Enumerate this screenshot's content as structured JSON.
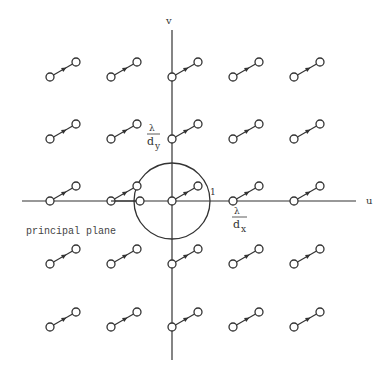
{
  "diagram": {
    "type": "reciprocal-lattice grating lobes diagram",
    "axes": {
      "u_label": "u",
      "v_label": "v",
      "origin": [
        172,
        201
      ],
      "u_range_px": [
        22,
        356
      ],
      "v_range_px": [
        30,
        360
      ]
    },
    "lattice": {
      "columns_px": [
        50,
        111,
        172,
        233,
        294
      ],
      "rows_px": [
        77,
        139,
        201,
        264,
        327
      ],
      "vector_offset_px": [
        26,
        -15
      ]
    },
    "unit_circle": {
      "center": [
        172,
        201
      ],
      "radius": 38,
      "label": "1"
    },
    "labels": {
      "lambda": "λ",
      "dy": "d",
      "dy_sub": "y",
      "dx": "d",
      "dx_sub": "x",
      "principal_plane": "principal plane",
      "circle_radius": "1"
    },
    "extra_points": [
      [
        140,
        201
      ]
    ],
    "colors": {
      "line": "#333333",
      "background": "#ffffff"
    }
  }
}
